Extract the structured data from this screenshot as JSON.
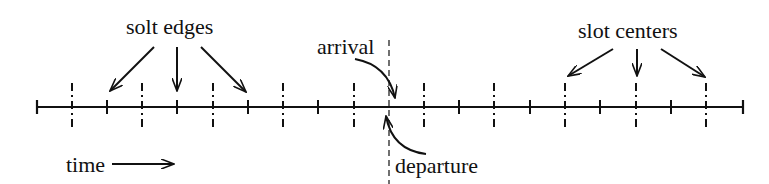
{
  "diagram": {
    "labels": {
      "slot_edges": "solt edges",
      "slot_centers": "slot centers",
      "arrival": "arrival",
      "departure": "departure",
      "time": "time"
    },
    "axis": {
      "x_start": 37,
      "x_end": 743,
      "y": 107
    },
    "edge_ticks_x": [
      107,
      177,
      248,
      318,
      389,
      459,
      530,
      600,
      671
    ],
    "center_ticks_x": [
      72,
      142,
      213,
      283,
      354,
      424,
      494,
      565,
      636,
      706
    ],
    "event_line_x": 389,
    "colors": {
      "ink": "#111111",
      "background": "#ffffff"
    }
  }
}
